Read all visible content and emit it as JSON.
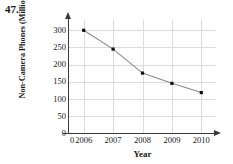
{
  "problem": {
    "number": "47."
  },
  "chart_data": {
    "type": "line",
    "title": "",
    "xlabel": "Year",
    "ylabel": "Non-Camera Phones (Millions)",
    "categories": [
      "2006",
      "2007",
      "2008",
      "2009",
      "2010"
    ],
    "values": [
      300,
      245,
      175,
      145,
      118
    ],
    "x_tick_labels": [
      "0",
      "2006",
      "2007",
      "2008",
      "2009",
      "2010"
    ],
    "y_tick_labels": [
      "0",
      "50",
      "100",
      "150",
      "200",
      "250",
      "300"
    ],
    "y_ticks": [
      0,
      50,
      100,
      150,
      200,
      250,
      300
    ],
    "ylim": [
      0,
      330
    ],
    "xlim": [
      2005.3,
      2010.6
    ],
    "grid": true,
    "legend": "none",
    "marker": "square",
    "marker_color": "#111111",
    "line_color": "#8a8a8a",
    "grid_color": "#dcdcdc",
    "axis_color": "#3a3a3a"
  }
}
